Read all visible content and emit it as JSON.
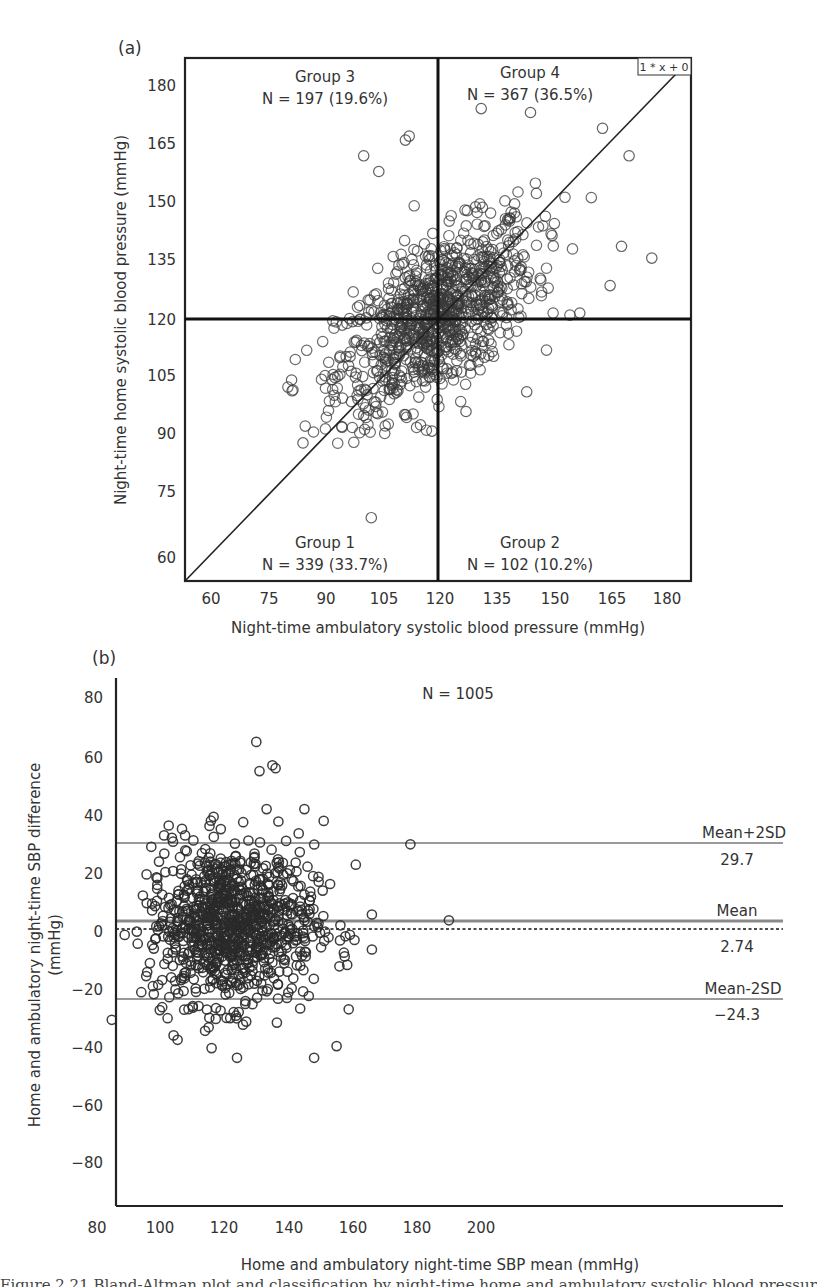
{
  "chart_data": [
    {
      "panel": "(a)",
      "type": "scatter",
      "title": "",
      "xlabel": "Night-time ambulatory systolic blood pressure (mmHg)",
      "ylabel": "Night-time home systolic blood pressure (mmHg)",
      "xlim": [
        53,
        186
      ],
      "ylim": [
        53,
        186
      ],
      "xticks": [
        60,
        75,
        90,
        105,
        120,
        135,
        150,
        165,
        180
      ],
      "yticks": [
        60,
        75,
        90,
        105,
        120,
        135,
        150,
        165,
        180
      ],
      "grid": false,
      "reference_lines": {
        "vertical_x": 120,
        "horizontal_y": 120,
        "identity_line": "y = x",
        "identity_label": "1 * x + 0"
      },
      "quadrants": [
        {
          "name": "Group 3",
          "label": "N = 197 (19.6%)",
          "n": 197,
          "pct": 19.6,
          "position": "top-left"
        },
        {
          "name": "Group 4",
          "label": "N = 367 (36.5%)",
          "n": 367,
          "pct": 36.5,
          "position": "top-right"
        },
        {
          "name": "Group 1",
          "label": "N = 339 (33.7%)",
          "n": 339,
          "pct": 33.7,
          "position": "bottom-left"
        },
        {
          "name": "Group 2",
          "label": "N = 102 (10.2%)",
          "n": 102,
          "pct": 10.2,
          "position": "bottom-right"
        }
      ],
      "n_total": 1005,
      "marker": "open-circle",
      "distribution": {
        "x_mean": 119,
        "y_mean": 121,
        "x_sd": 13,
        "y_sd": 12,
        "correlation": 0.6
      },
      "notable_points": [
        {
          "x": 102,
          "y": 70
        },
        {
          "x": 84,
          "y": 89
        },
        {
          "x": 81,
          "y": 105
        },
        {
          "x": 100,
          "y": 162
        },
        {
          "x": 111,
          "y": 166
        },
        {
          "x": 112,
          "y": 167
        },
        {
          "x": 104,
          "y": 158
        },
        {
          "x": 131,
          "y": 174
        },
        {
          "x": 144,
          "y": 173
        },
        {
          "x": 163,
          "y": 169
        },
        {
          "x": 170,
          "y": 162
        },
        {
          "x": 176,
          "y": 136
        },
        {
          "x": 168,
          "y": 139
        },
        {
          "x": 165,
          "y": 129
        },
        {
          "x": 157,
          "y": 122
        },
        {
          "x": 127,
          "y": 97
        },
        {
          "x": 143,
          "y": 102
        },
        {
          "x": 118,
          "y": 92
        },
        {
          "x": 100,
          "y": 96
        }
      ]
    },
    {
      "panel": "(b)",
      "type": "scatter",
      "title": "N = 1005",
      "xlabel": "Home and ambulatory night-time SBP mean (mmHg)",
      "ylabel": "Home and ambulatory night-time SBP difference (mmHg)",
      "xlim": [
        74,
        207
      ],
      "ylim": [
        -90,
        90
      ],
      "xticks": [
        80,
        100,
        120,
        140,
        160,
        180,
        200
      ],
      "yticks": [
        80,
        60,
        40,
        20,
        0,
        -20,
        -40,
        -60,
        -80
      ],
      "grid": false,
      "n_total": 1005,
      "marker": "open-circle",
      "reference_lines": [
        {
          "label": "Mean+2SD",
          "value": 29.7,
          "value_label": "29.7",
          "style": "solid-gray"
        },
        {
          "label": "Mean",
          "value": 2.74,
          "value_label": "2.74",
          "style": "solid-gray-thick"
        },
        {
          "label": "Mean-2SD",
          "value": -24.3,
          "value_label": "−24.3",
          "style": "solid-gray"
        },
        {
          "label": "",
          "value": 0,
          "value_label": "",
          "style": "dotted-black"
        }
      ],
      "distribution": {
        "x_mean": 122,
        "y_mean": 2.74,
        "x_sd": 13,
        "y_sd": 13.5
      },
      "notable_points": [
        {
          "x": 85,
          "y": -30
        },
        {
          "x": 89,
          "y": -1
        },
        {
          "x": 130,
          "y": 65
        },
        {
          "x": 131,
          "y": 55
        },
        {
          "x": 135,
          "y": 57
        },
        {
          "x": 136,
          "y": 56
        },
        {
          "x": 178,
          "y": 30
        },
        {
          "x": 190,
          "y": 4
        },
        {
          "x": 166,
          "y": -6
        },
        {
          "x": 166,
          "y": 6
        },
        {
          "x": 124,
          "y": -43
        },
        {
          "x": 148,
          "y": -43
        },
        {
          "x": 155,
          "y": -39
        },
        {
          "x": 145,
          "y": 42
        },
        {
          "x": 161,
          "y": 23
        },
        {
          "x": 151,
          "y": 38
        }
      ]
    }
  ],
  "panels": {
    "a": {
      "label": "(a)",
      "ticks_x": [
        "60",
        "75",
        "90",
        "105",
        "120",
        "135",
        "150",
        "165",
        "180"
      ],
      "ticks_y": [
        "180",
        "165",
        "150",
        "135",
        "120",
        "105",
        "90",
        "75",
        "60"
      ],
      "xlabel": "Night-time ambulatory systolic blood pressure (mmHg)",
      "ylabel": "Night-time home systolic blood pressure (mmHg)",
      "identity_label": "1 * x + 0",
      "g3_name": "Group 3",
      "g3_n": "N = 197 (19.6%)",
      "g4_name": "Group 4",
      "g4_n": "N = 367 (36.5%)",
      "g1_name": "Group 1",
      "g1_n": "N = 339 (33.7%)",
      "g2_name": "Group 2",
      "g2_n": "N = 102 (10.2%)"
    },
    "b": {
      "label": "(b)",
      "n_label": "N = 1005",
      "ticks_x": [
        "80",
        "100",
        "120",
        "140",
        "160",
        "180",
        "200"
      ],
      "ticks_y": [
        "80",
        "60",
        "40",
        "20",
        "0",
        "−20",
        "−40",
        "−60",
        "−80"
      ],
      "xlabel": "Home and ambulatory night-time SBP mean (mmHg)",
      "ylabel_line1": "Home and ambulatory night-time SBP difference",
      "ylabel_line2": "(mmHg)",
      "upper_name": "Mean+2SD",
      "upper_value": "29.7",
      "mean_name": "Mean",
      "mean_value": "2.74",
      "lower_name": "Mean-2SD",
      "lower_value": "−24.3"
    }
  },
  "caption": "Figure 2.21 Bland-Altman plot and classification by night-time home and ambulatory systolic blood pressure."
}
